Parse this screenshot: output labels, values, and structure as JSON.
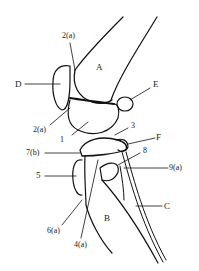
{
  "diagram": {
    "labels": {
      "A": "A",
      "B": "B",
      "C": "C",
      "D": "D",
      "E": "E",
      "F": "F",
      "l_2a_top": "2(a)",
      "l_2a_bottom": "2(a)",
      "l_1": "1",
      "l_3": "3",
      "l_7b": "7(b)",
      "l_8": "8",
      "l_9a": "9(a)",
      "l_5": "5",
      "l_6a": "6(a)",
      "l_4a": "4(a)"
    }
  }
}
